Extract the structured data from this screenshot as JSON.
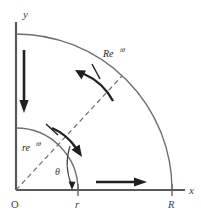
{
  "figure": {
    "kind": "contour-diagram",
    "background_color": "#ffffff",
    "line_color": "#6d6e71",
    "arrow_color": "#231f20",
    "axis_color": "#58595b"
  },
  "axes": {
    "x_label": "x",
    "y_label": "y",
    "origin_label": "O"
  },
  "ticks": {
    "inner_radius_label": "r",
    "outer_radius_label": "R"
  },
  "labels": {
    "inner_arc_base": "re",
    "inner_arc_exponent": "iθ",
    "outer_arc_base": "Re",
    "outer_arc_exponent": "iθ",
    "angle": "θ"
  },
  "arrows": {
    "y_axis_direction": "down",
    "x_axis_direction": "right",
    "outer_arc_direction": "counterclockwise",
    "inner_arc_direction": "clockwise",
    "angle_arc_direction": "toward-x-axis"
  },
  "geometry": {
    "origin_x": 16,
    "origin_y": 190,
    "inner_radius": 62,
    "outer_radius": 156,
    "radial_angle_deg": 47
  }
}
